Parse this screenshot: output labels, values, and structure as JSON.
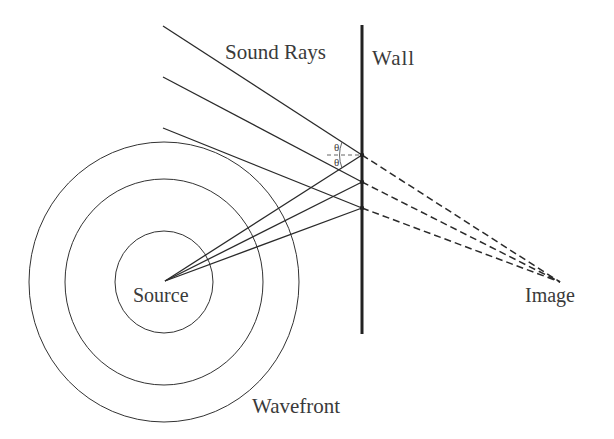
{
  "diagram": {
    "labels": {
      "sound_rays": "Sound Rays",
      "wall": "Wall",
      "source": "Source",
      "image": "Image",
      "wavefront": "Wavefront",
      "theta_incident": "θ",
      "theta_reflected": "θ"
    },
    "colors": {
      "line": "#2a2a2a",
      "text": "#3a3a3a",
      "background": "#ffffff"
    },
    "points": {
      "source": [
        165,
        281
      ],
      "image": [
        560,
        282
      ],
      "wall_top": [
        362,
        25
      ],
      "wall_bottom": [
        362,
        334
      ],
      "reflections": [
        [
          362,
          155
        ],
        [
          362,
          182
        ],
        [
          362,
          208
        ]
      ],
      "ray_ends": [
        [
          163,
          26
        ],
        [
          163,
          77
        ],
        [
          163,
          128
        ]
      ]
    },
    "wavefronts": [
      {
        "cx": 164,
        "cy": 282,
        "rx": 49,
        "ry": 51
      },
      {
        "cx": 164,
        "cy": 282,
        "rx": 99,
        "ry": 103
      },
      {
        "cx": 164,
        "cy": 282,
        "rx": 135,
        "ry": 140
      }
    ]
  }
}
